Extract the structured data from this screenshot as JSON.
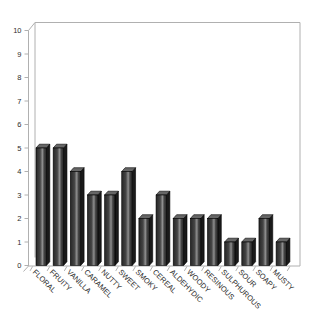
{
  "chart_data": {
    "type": "bar",
    "style": "3d-column",
    "title": "",
    "xlabel": "",
    "ylabel": "",
    "categories": [
      "FLORAL",
      "FRUITY",
      "VANILLA",
      "CARAMEL",
      "NUTTY",
      "SWEET",
      "SMOKY",
      "CEREAL",
      "ALDEHYDIC",
      "WOODY",
      "RESINOUS",
      "SULPHUROUS",
      "SOUR",
      "SOAPY",
      "MUSTY"
    ],
    "values": [
      5,
      5,
      4,
      3,
      3,
      4,
      2,
      3,
      2,
      2,
      2,
      1,
      1,
      2,
      1
    ],
    "ylim": [
      0,
      10
    ],
    "y_tick_step": 1,
    "grid": false,
    "legend": false,
    "colors": {
      "background": "#ffffff",
      "bar_front_dark": "#262626",
      "bar_front_mid": "#454545",
      "bar_front_highlight": "#8f8f8f",
      "bar_side": "#1a1a1a",
      "bar_top": "#666666",
      "bar_outline": "#000000",
      "wall_line": "#b0b0b0",
      "tick_line": "#9a9a9a",
      "label_text": "#2e2e2e"
    }
  }
}
